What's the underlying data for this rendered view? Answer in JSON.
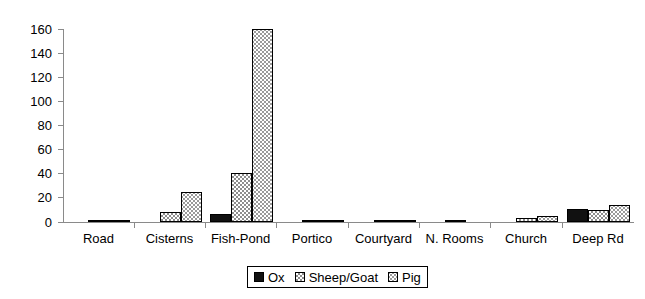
{
  "chart_data": {
    "type": "bar",
    "title": "",
    "subtitle": "",
    "xlabel": "",
    "ylabel": "",
    "ylim": [
      0,
      160
    ],
    "ytick_step": 20,
    "yticks": [
      0,
      20,
      40,
      60,
      80,
      100,
      120,
      140,
      160
    ],
    "grid": false,
    "legend_position": "bottom",
    "categories": [
      "Road",
      "Cisterns",
      "Fish-Pond",
      "Portico",
      "Courtyard",
      "N. Rooms",
      "Church",
      "Deep Rd"
    ],
    "series": [
      {
        "name": "Ox",
        "color": "#111111",
        "pattern": "solid-black",
        "values": [
          0,
          0,
          7,
          0,
          0,
          0,
          0,
          11
        ]
      },
      {
        "name": "Sheep/Goat",
        "color": "#8e8e8e",
        "pattern": "checker-medium",
        "values": [
          1,
          8,
          41,
          1,
          1,
          2,
          3,
          10
        ]
      },
      {
        "name": "Pig",
        "color": "#9a9a9a",
        "pattern": "dotted-light",
        "values": [
          1,
          25,
          160,
          1,
          2,
          0,
          5,
          14
        ]
      }
    ]
  },
  "axis": {
    "y_tick_labels": [
      "160",
      "140",
      "120",
      "100",
      "80",
      "60",
      "40",
      "20",
      "0"
    ],
    "x_tick_labels": [
      "Road",
      "Cisterns",
      "Fish-Pond",
      "Portico",
      "Courtyard",
      "N. Rooms",
      "Church",
      "Deep Rd"
    ]
  },
  "legend": {
    "items": [
      {
        "label": "Ox",
        "swatch": "ox"
      },
      {
        "label": "Sheep/Goat",
        "swatch": "sheep"
      },
      {
        "label": "Pig",
        "swatch": "pig"
      }
    ]
  }
}
